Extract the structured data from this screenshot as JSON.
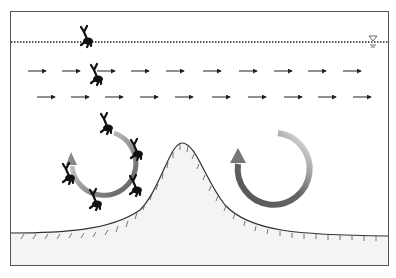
{
  "diagram": {
    "frame": {
      "x": 10,
      "y": 11,
      "width": 379,
      "height": 255,
      "stroke": "#555555"
    },
    "water_surface": {
      "y": 42,
      "x1": 10,
      "x2": 389,
      "style": "dotted",
      "symbol": "water-level-triangle",
      "symbol_x": 373
    },
    "current_rows": [
      {
        "y": 71,
        "starts": [
          28,
          62,
          97,
          131,
          166,
          203,
          239,
          274,
          308,
          343
        ],
        "length": 18
      },
      {
        "y": 97,
        "starts": [
          37,
          71,
          105,
          140,
          175,
          212,
          248,
          284,
          318,
          353
        ],
        "length": 18
      }
    ],
    "organisms": [
      {
        "x": 86,
        "y": 39,
        "rot": 0,
        "role": "at-surface"
      },
      {
        "x": 96,
        "y": 76,
        "rot": 0,
        "role": "drifting"
      },
      {
        "x": 106,
        "y": 124,
        "rot": 0,
        "role": "circulating"
      },
      {
        "x": 137,
        "y": 151,
        "rot": 15,
        "role": "circulating"
      },
      {
        "x": 133,
        "y": 186,
        "rot": 20,
        "role": "circulating"
      },
      {
        "x": 97,
        "y": 199,
        "rot": 5,
        "role": "circulating"
      },
      {
        "x": 70,
        "y": 174,
        "rot": -10,
        "role": "circulating"
      }
    ],
    "eddies": [
      {
        "name": "left-eddy",
        "cx": 105,
        "cy": 164,
        "r": 32,
        "direction": "counterclockwise",
        "arrow_at": "upper-left"
      },
      {
        "name": "right-eddy",
        "cx": 266,
        "cy": 164,
        "r": 36,
        "direction": "counterclockwise",
        "arrow_at": "upper-left"
      }
    ],
    "seabed": {
      "fill": "#f4f4f4",
      "stroke": "#333333",
      "peak": {
        "x": 182,
        "y": 143
      },
      "left_level": 233,
      "right_level": 236
    },
    "colors": {
      "arrow": "#222222",
      "organism": "#111111",
      "eddy_dark": "#555555",
      "eddy_light": "#dddddd"
    }
  }
}
